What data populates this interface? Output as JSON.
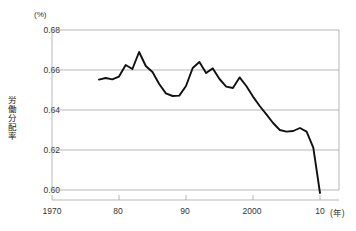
{
  "chart_data": {
    "type": "line",
    "title": "",
    "xlabel": "年",
    "ylabel": "労働分配率",
    "yunit": "(%)",
    "xunit": "(年)",
    "ylim": [
      0.59,
      0.685
    ],
    "xlim": [
      1970,
      2011
    ],
    "grid": true,
    "legend": false,
    "yticks": [
      "0.68",
      "0.66",
      "0.64",
      "0.62",
      "0.60"
    ],
    "ytick_values": [
      0.68,
      0.66,
      0.64,
      0.62,
      0.6
    ],
    "xticks": [
      "1970",
      "80",
      "90",
      "2000",
      "10"
    ],
    "xtick_values": [
      1970,
      1980,
      1990,
      2000,
      2010
    ],
    "series": [
      {
        "name": "労働分配率",
        "color": "#111111",
        "x": [
          1977,
          1978,
          1979,
          1980,
          1981,
          1982,
          1983,
          1984,
          1985,
          1986,
          1987,
          1988,
          1989,
          1990,
          1991,
          1992,
          1993,
          1994,
          1995,
          1996,
          1997,
          1998,
          1999,
          2000,
          2001,
          2002,
          2003,
          2004,
          2005,
          2006,
          2007,
          2008,
          2009,
          2010
        ],
        "y": [
          0.6552,
          0.656,
          0.6553,
          0.6567,
          0.6625,
          0.6605,
          0.669,
          0.662,
          0.659,
          0.653,
          0.6483,
          0.647,
          0.6472,
          0.652,
          0.661,
          0.664,
          0.6585,
          0.6608,
          0.6555,
          0.6517,
          0.651,
          0.6563,
          0.652,
          0.6467,
          0.642,
          0.6378,
          0.6335,
          0.63,
          0.6292,
          0.6295,
          0.631,
          0.6292,
          0.6212,
          0.5985
        ]
      }
    ]
  },
  "axes": {
    "y_unit_label": "(%)",
    "y_axis_title": "労働分配率",
    "x_unit_label": "(年)"
  }
}
